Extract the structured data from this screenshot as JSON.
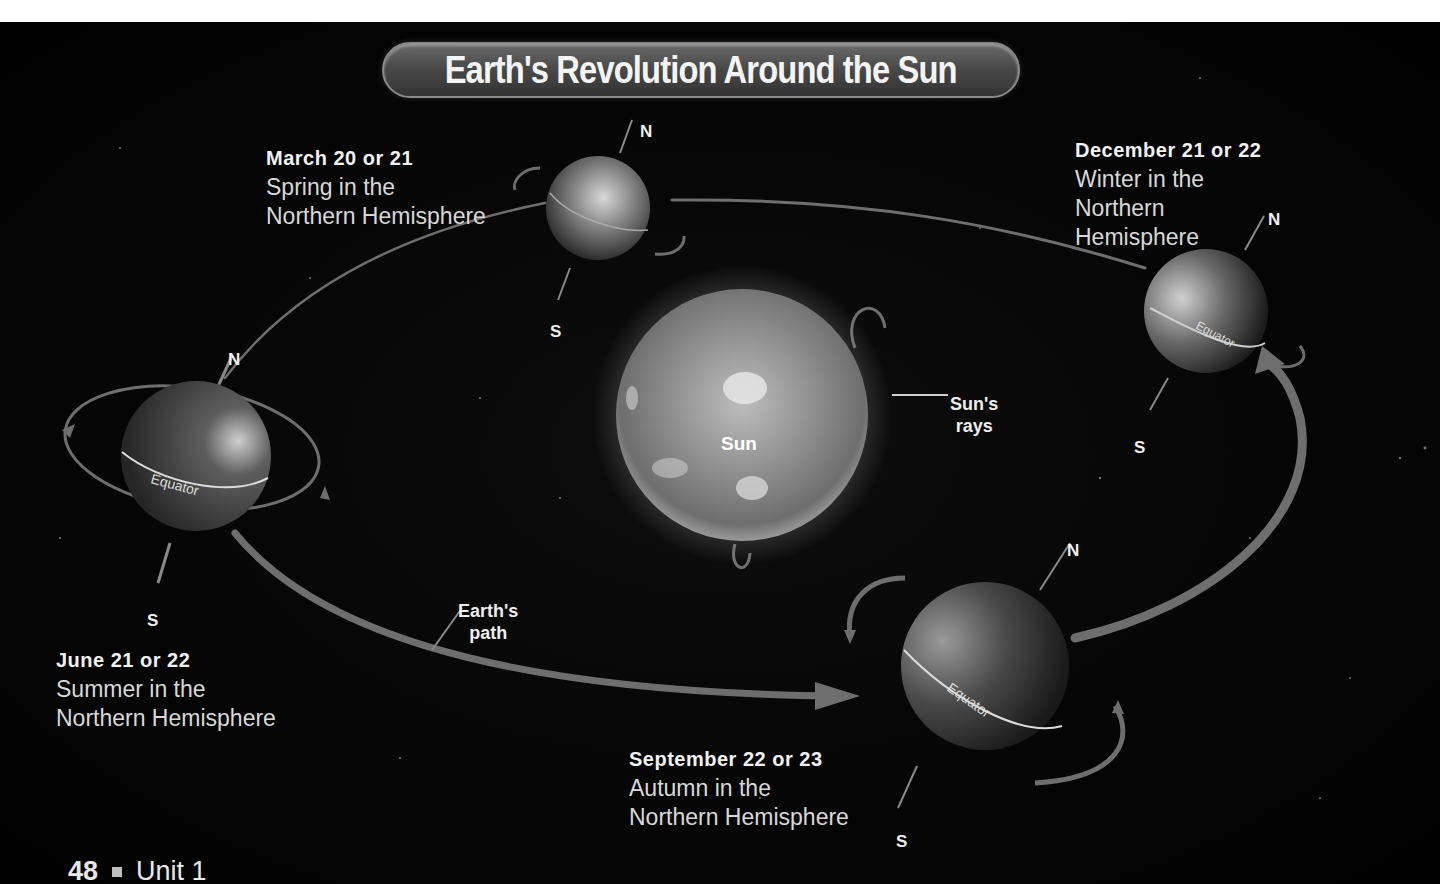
{
  "title": "Earth's Revolution Around the Sun",
  "sun": {
    "label": "Sun",
    "rays_label_line1": "Sun's",
    "rays_label_line2": "rays"
  },
  "path_label": {
    "line1": "Earth's",
    "line2": "path"
  },
  "positions": [
    {
      "id": "march",
      "date": "March 20 or 21",
      "season_line1": "Spring in the",
      "season_line2": "Northern Hemisphere",
      "north": "N",
      "south": "S"
    },
    {
      "id": "december",
      "date": "December 21 or 22",
      "season_line1": "Winter in the",
      "season_line2": "Northern",
      "season_line3": "Hemisphere",
      "north": "N",
      "south": "S",
      "equator": "Equator"
    },
    {
      "id": "june",
      "date": "June 21 or 22",
      "season_line1": "Summer in the",
      "season_line2": "Northern Hemisphere",
      "north": "N",
      "south": "S",
      "equator": "Equator"
    },
    {
      "id": "september",
      "date": "September 22 or 23",
      "season_line1": "Autumn in the",
      "season_line2": "Northern Hemisphere",
      "north": "N",
      "south": "S",
      "equator": "Equator"
    }
  ],
  "footer": {
    "page_number": "48",
    "unit": "Unit 1"
  },
  "colors": {
    "background": "#050505",
    "orbit": "#6e6e6e",
    "text": "#d8d8d8",
    "title_pill": "#4a4a4a"
  }
}
